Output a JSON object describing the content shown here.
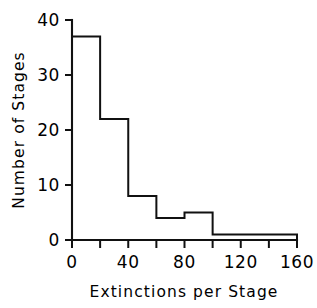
{
  "chart_data": {
    "type": "bar",
    "title": "",
    "subtitle": "",
    "xlabel": "Extinctions per Stage",
    "ylabel": "Number of Stages",
    "categories": [
      "0-20",
      "20-40",
      "40-60",
      "60-80",
      "80-100",
      "100-120",
      "120-140",
      "140-160"
    ],
    "bin_edges": [
      0,
      20,
      40,
      60,
      80,
      100,
      120,
      140,
      160
    ],
    "bin_width": 20,
    "values": [
      37,
      22,
      8,
      4,
      5,
      1,
      1,
      1
    ],
    "xlim": [
      0,
      160
    ],
    "ylim": [
      0,
      40
    ],
    "x_tick_values": [
      0,
      20,
      40,
      60,
      80,
      100,
      120,
      140,
      160
    ],
    "x_tick_labels": [
      "0",
      "",
      "40",
      "",
      "80",
      "",
      "120",
      "",
      "160"
    ],
    "y_tick_values": [
      0,
      10,
      20,
      30,
      40
    ],
    "y_tick_labels": [
      "0",
      "10",
      "20",
      "30",
      "40"
    ],
    "grid": false,
    "legend": false,
    "legend_position": "none",
    "bar_fill": "#ffffff",
    "bar_stroke": "#111111",
    "background": "#ffffff",
    "axis_color": "#111111"
  },
  "labels": {
    "x_axis_title": "Extinctions per Stage",
    "y_axis_title": "Number of Stages",
    "x_ticks": [
      "0",
      "40",
      "80",
      "120",
      "160"
    ],
    "y_ticks": [
      "0",
      "10",
      "20",
      "30",
      "40"
    ]
  }
}
